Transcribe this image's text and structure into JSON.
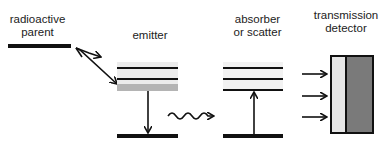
{
  "labels": {
    "parent": [
      "radioactive",
      "parent"
    ],
    "emitter": "emitter",
    "absorber": [
      "absorber",
      "or scatter"
    ],
    "detector": [
      "transmission",
      "detector"
    ]
  },
  "colors": {
    "line": "#111111",
    "band_light": "#ececec",
    "band_mid": "#b4b4b4",
    "detector_window": "#e6e6e6",
    "detector_body": "#7a7a7a"
  }
}
